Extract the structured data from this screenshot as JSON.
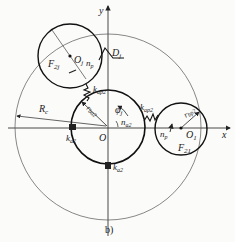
{
  "figure": {
    "caption": "b)",
    "axes": {
      "x_label": "x",
      "y_label": "y",
      "origin_label": "O"
    },
    "labels": {
      "F2": "F",
      "F2_sub": "2j",
      "O2": "O",
      "O2_sub": "j",
      "n_p_upper": "n",
      "n_p_upper_sub": "p",
      "D_j": "D",
      "D_j_sub": "j",
      "k_ap2_upper": "k",
      "k_ap2_upper_sub": "ap2",
      "k_ap2_right": "k",
      "k_ap2_right_sub": "ap2",
      "R_c": "R",
      "R_c_sub": "c",
      "r_ba2": "r",
      "r_ba2_sub": "ba2",
      "phi_j": "φ",
      "phi_j_sub": "j",
      "n_a2": "n",
      "n_a2_sub": "a2",
      "k_a2_left": "k",
      "k_a2_left_sub": "a2",
      "k_a2_bottom": "k",
      "k_a2_bottom_sub": "a2",
      "r_bp2": "r",
      "r_bp2_sub": "bp2",
      "n_p_right": "n",
      "n_p_right_sub": "p",
      "O1": "O",
      "O1_sub": "1",
      "F21": "F",
      "F21_sub": "21"
    }
  }
}
